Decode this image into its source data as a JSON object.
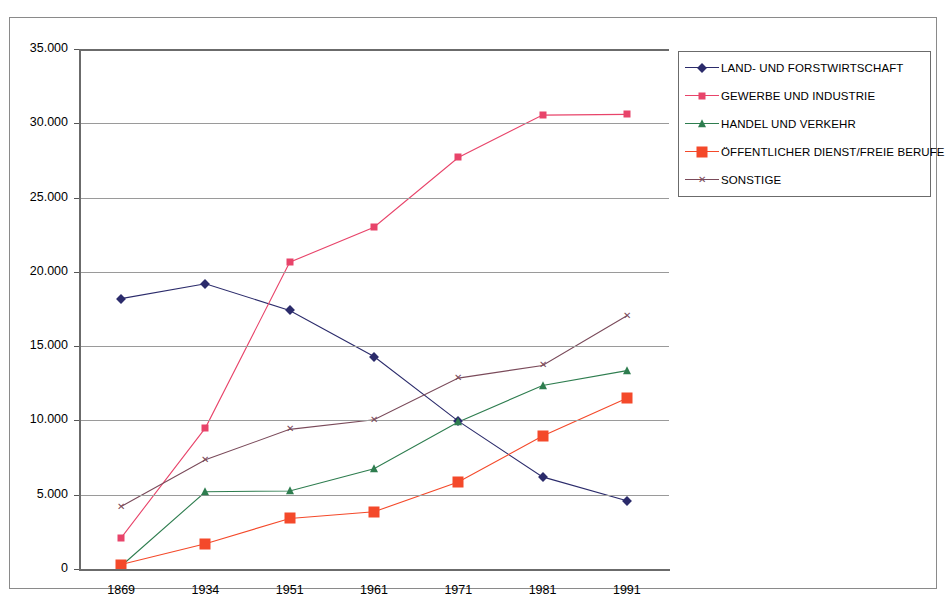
{
  "figure": {
    "scan_remnant": "",
    "frame_color": "#8a8a8a"
  },
  "legend": {
    "position": "top-right",
    "items": [
      {
        "label": "LAND- UND FORSTWIRTSCHAFT",
        "color": "#2b2b6b",
        "marker": "diamond-icon"
      },
      {
        "label": "GEWERBE UND INDUSTRIE",
        "color": "#e8446a",
        "marker": "square-small-icon"
      },
      {
        "label": "HANDEL UND VERKEHR",
        "color": "#2e7d4f",
        "marker": "triangle-icon"
      },
      {
        "label": "ÖFFENTLICHER DIENST/FREIE BERUFE",
        "color": "#f4492a",
        "marker": "square-large-icon"
      },
      {
        "label": "SONSTIGE",
        "color": "#7a4a5a",
        "marker": "x-icon"
      }
    ]
  },
  "axes": {
    "y_tick_labels": [
      "35.000",
      "30.000",
      "25.000",
      "20.000",
      "15.000",
      "10.000",
      "5.000",
      "0"
    ],
    "x_tick_labels": [
      "1869",
      "1934",
      "1951",
      "1961",
      "1971",
      "1981",
      "1991"
    ]
  },
  "chart_data": {
    "type": "line",
    "title": "",
    "xlabel": "",
    "ylabel": "",
    "categories": [
      "1869",
      "1934",
      "1951",
      "1961",
      "1971",
      "1981",
      "1991"
    ],
    "ylim": [
      0,
      35000
    ],
    "ytick_step": 5000,
    "grid": true,
    "legend_position": "top-right",
    "series": [
      {
        "name": "LAND- UND FORSTWIRTSCHAFT",
        "color": "#2b2b6b",
        "marker": "diamond",
        "values": [
          18200,
          19200,
          17400,
          14300,
          9950,
          6200,
          4600
        ]
      },
      {
        "name": "GEWERBE UND INDUSTRIE",
        "color": "#e8446a",
        "marker": "square-small",
        "values": [
          2100,
          9500,
          20650,
          23000,
          27700,
          30550,
          30600
        ]
      },
      {
        "name": "HANDEL UND VERKEHR",
        "color": "#2e7d4f",
        "marker": "triangle",
        "values": [
          200,
          5200,
          5250,
          6750,
          9900,
          12350,
          13350
        ]
      },
      {
        "name": "ÖFFENTLICHER DIENST/FREIE BERUFE",
        "color": "#f4492a",
        "marker": "square-large",
        "values": [
          300,
          1700,
          3400,
          3850,
          5850,
          8950,
          11500
        ]
      },
      {
        "name": "SONSTIGE",
        "color": "#7a4a5a",
        "marker": "x",
        "values": [
          4200,
          7350,
          9400,
          10050,
          12850,
          13700,
          17050
        ]
      }
    ]
  }
}
